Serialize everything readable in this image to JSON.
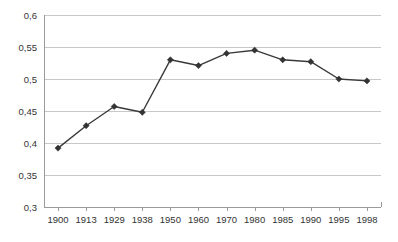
{
  "chart_data": {
    "type": "line",
    "title": "",
    "subtitle": "",
    "xlabel": "",
    "ylabel": "",
    "categories": [
      "1900",
      "1913",
      "1929",
      "1938",
      "1950",
      "1960",
      "1970",
      "1980",
      "1985",
      "1990",
      "1995",
      "1998"
    ],
    "values": [
      0.392,
      0.427,
      0.457,
      0.448,
      0.53,
      0.521,
      0.54,
      0.545,
      0.53,
      0.527,
      0.5,
      0.497
    ],
    "series": [
      {
        "name": "",
        "values": [
          0.392,
          0.427,
          0.457,
          0.448,
          0.53,
          0.521,
          0.54,
          0.545,
          0.53,
          0.527,
          0.5,
          0.497
        ]
      }
    ],
    "ylim": [
      0.3,
      0.6
    ],
    "ytick_values": [
      0.3,
      0.35,
      0.4,
      0.45,
      0.5,
      0.55,
      0.6
    ],
    "ytick_labels": [
      "0,3",
      "0,35",
      "0,4",
      "0,45",
      "0,5",
      "0,55",
      "0,6"
    ],
    "xtick_labels": [
      "1900",
      "1913",
      "1929",
      "1938",
      "1950",
      "1960",
      "1970",
      "1980",
      "1985",
      "1990",
      "1995",
      "1998"
    ],
    "grid": true,
    "grid_axis": "y",
    "legend": false,
    "legend_position": "none",
    "marker": "diamond",
    "annotations": [],
    "colors": {
      "line": "#3a3a3a",
      "marker": "#333333",
      "gridline": "#c8c8c8",
      "axis": "#9a9a9a",
      "text": "#333333",
      "background": "#ffffff"
    }
  }
}
